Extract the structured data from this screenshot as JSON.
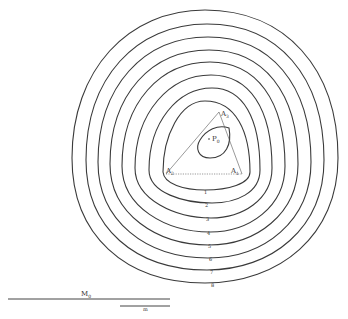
{
  "diagram": {
    "stroke_color": "#3a3a3a",
    "background": "#ffffff",
    "triangle": {
      "vertices": [
        {
          "name": "A1",
          "label": "A",
          "sub": "1",
          "x": 242,
          "y": 174
        },
        {
          "name": "A2",
          "label": "A",
          "sub": "2",
          "x": 166,
          "y": 174
        },
        {
          "name": "A3",
          "label": "A",
          "sub": "3",
          "x": 219,
          "y": 112
        }
      ],
      "base_edge_style": "dotted"
    },
    "point": {
      "label": "P",
      "sub": "0",
      "x": 211,
      "y": 139
    },
    "inner_loop": "teardrop around P0",
    "rings": {
      "count": 8,
      "labels": [
        "1",
        "2",
        "3",
        "4",
        "5",
        "6",
        "7",
        "8"
      ]
    },
    "scale_bars": [
      {
        "name": "M0",
        "label": "M",
        "sub": "0",
        "x1": 8,
        "x2": 170,
        "y": 299
      },
      {
        "name": "m",
        "label": "m",
        "x1": 120,
        "x2": 170,
        "y": 306
      }
    ]
  }
}
